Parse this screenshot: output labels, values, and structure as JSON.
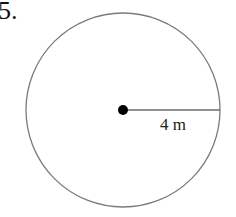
{
  "problem": {
    "number": "5."
  },
  "figure": {
    "shape": "circle",
    "radius_label": "4 m",
    "stroke_color": "#7a7a7a",
    "center_dot_color": "#000000"
  }
}
